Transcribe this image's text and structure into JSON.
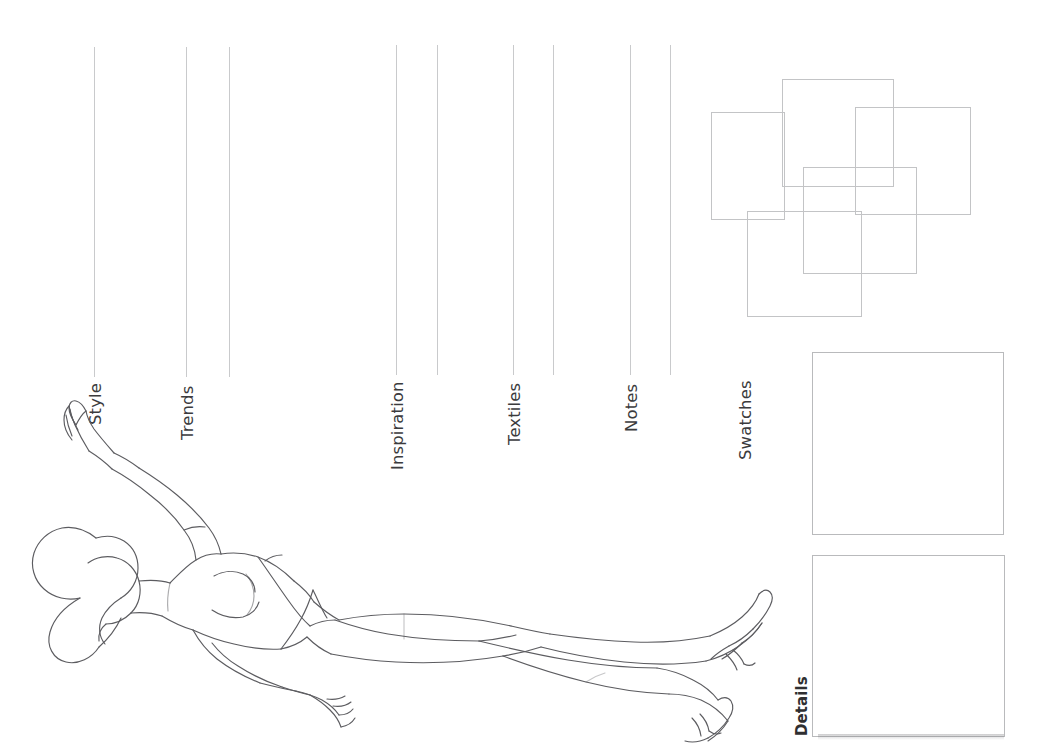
{
  "page": {
    "background_color": "#ffffff",
    "line_color": "#b9babc",
    "text_color": "#3b3b3d",
    "width": 1047,
    "height": 743,
    "orientation": "rotated-90"
  },
  "sections": [
    {
      "label": "Style",
      "rule_x": 94,
      "label_x": 86,
      "label_y": 425
    },
    {
      "label": "Trends",
      "rule_x": 186,
      "label_x": 178,
      "label_y": 440
    },
    {
      "label": "Inspiration",
      "rule_x": 396,
      "label_x": 388,
      "label_y": 470
    },
    {
      "label": "Textiles",
      "rule_x": 513,
      "label_x": 505,
      "label_y": 445
    },
    {
      "label": "Notes",
      "rule_x": 630,
      "label_x": 622,
      "label_y": 432
    },
    {
      "label": "Swatches",
      "rule_x": 744,
      "label_x": 744,
      "label_y": 460
    },
    {
      "label": "Details",
      "rule_x": 0,
      "label_x": 796,
      "label_y": 735
    }
  ],
  "rules": [
    {
      "x": 94,
      "y": 47,
      "height": 330
    },
    {
      "x": 186,
      "y": 47,
      "height": 330
    },
    {
      "x": 229,
      "y": 47,
      "height": 330
    },
    {
      "x": 396,
      "y": 45,
      "height": 330
    },
    {
      "x": 437,
      "y": 45,
      "height": 330
    },
    {
      "x": 513,
      "y": 45,
      "height": 330
    },
    {
      "x": 553,
      "y": 45,
      "height": 330
    },
    {
      "x": 630,
      "y": 45,
      "height": 330
    },
    {
      "x": 670,
      "y": 45,
      "height": 330
    }
  ],
  "swatch_squares": [
    {
      "name": "swatch-square-1",
      "x": 711,
      "y": 112,
      "width": 72,
      "height": 106
    },
    {
      "name": "swatch-square-2",
      "x": 782,
      "y": 79,
      "width": 110,
      "height": 106
    },
    {
      "name": "swatch-square-3",
      "x": 855,
      "y": 107,
      "width": 114,
      "height": 106
    },
    {
      "name": "swatch-square-4",
      "x": 803,
      "y": 167,
      "width": 112,
      "height": 105
    },
    {
      "name": "swatch-square-5",
      "x": 747,
      "y": 211,
      "width": 113,
      "height": 104
    }
  ],
  "detail_boxes": [
    {
      "name": "detail-box-upper",
      "x": 812,
      "y": 352,
      "width": 190,
      "height": 181
    },
    {
      "name": "detail-box-lower",
      "x": 812,
      "y": 555,
      "width": 191,
      "height": 180
    }
  ],
  "croquis": {
    "name": "fashion-croquis-figure",
    "description": "Reclining female fashion figure outline with raised arm, swimsuit lines and high-heeled feet",
    "stroke_color": "#5c5c60"
  }
}
